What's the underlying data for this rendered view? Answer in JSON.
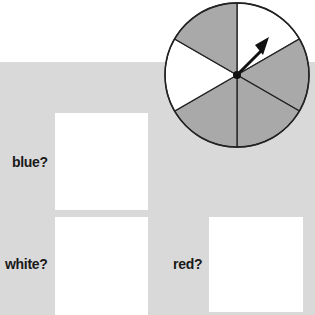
{
  "spinner": {
    "sectors": [
      {
        "position": "top-right",
        "color": "#ffffff"
      },
      {
        "position": "right",
        "color": "#a9a9a9"
      },
      {
        "position": "bottom-right",
        "color": "#a9a9a9"
      },
      {
        "position": "bottom-left",
        "color": "#a9a9a9"
      },
      {
        "position": "left",
        "color": "#ffffff"
      },
      {
        "position": "top-left",
        "color": "#a9a9a9"
      }
    ],
    "arrow_points_to": "top-right"
  },
  "questions": [
    {
      "label": "blue?"
    },
    {
      "label": "white?"
    },
    {
      "label": "red?"
    }
  ],
  "colors": {
    "panel": "#d9d9d9",
    "sector_gray": "#a9a9a9",
    "box": "#ffffff"
  }
}
